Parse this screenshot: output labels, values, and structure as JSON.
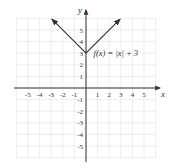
{
  "chart_data": {
    "type": "line",
    "title": "",
    "function_label": "f(x) = |x| + 3",
    "xlabel": "x",
    "ylabel": "y",
    "xlim": [
      -6,
      6
    ],
    "ylim": [
      -6,
      6
    ],
    "x_ticks": [
      -5,
      -4,
      -3,
      -2,
      -1,
      1,
      2,
      3,
      4,
      5
    ],
    "y_ticks": [
      -5,
      -4,
      -3,
      -2,
      -1,
      1,
      2,
      3,
      4,
      5
    ],
    "grid": true,
    "series": [
      {
        "name": "f(x) = |x| + 3",
        "x": [
          -3,
          0,
          3
        ],
        "y": [
          6,
          3,
          6
        ],
        "arrows_at_ends": true
      }
    ],
    "vertex": {
      "x": 0,
      "y": 3
    }
  },
  "colors": {
    "grid": "#cfcfcf",
    "axis": "#333333",
    "curve": "#333333",
    "background": "#ffffff"
  }
}
